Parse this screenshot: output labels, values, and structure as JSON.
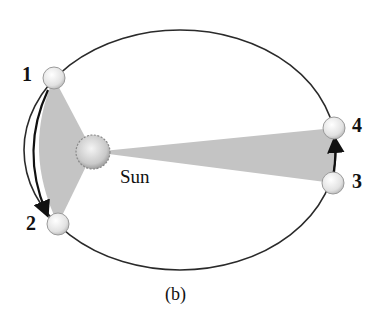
{
  "figure": {
    "caption": "(b)",
    "sun_label": "Sun",
    "positions": [
      {
        "label": "1"
      },
      {
        "label": "2"
      },
      {
        "label": "3"
      },
      {
        "label": "4"
      }
    ],
    "colors": {
      "orbit": "#2a2a2a",
      "swept_area": "#c4c4c4",
      "planet": "#e6e6e6",
      "sun": "#cfcfcf",
      "arrow": "#111111"
    }
  }
}
